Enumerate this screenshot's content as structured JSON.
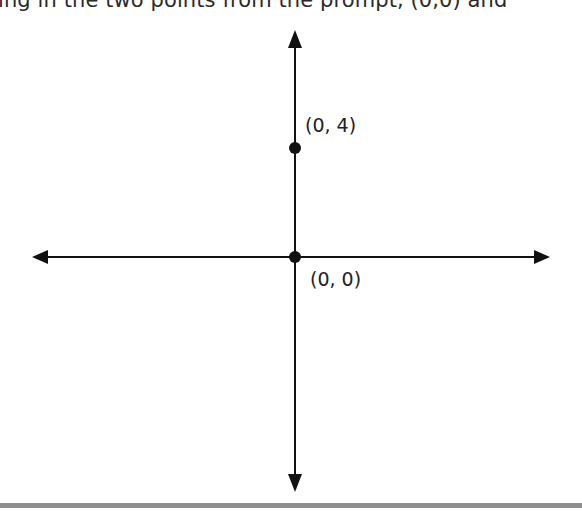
{
  "header": {
    "partial_text": "ing in the two points from the prompt, (0,0) and"
  },
  "diagram": {
    "type": "coordinate-plane",
    "axes": {
      "horizontal": {
        "y": 257,
        "x_start": 32,
        "x_end": 550,
        "arrows": "both"
      },
      "vertical": {
        "x": 295,
        "y_start": 30,
        "y_end": 492,
        "arrows": "both"
      },
      "color": "#111111"
    },
    "points": [
      {
        "label": "(0, 4)",
        "x": 0,
        "y": 4,
        "px": 295,
        "py": 148
      },
      {
        "label": "(0, 0)",
        "x": 0,
        "y": 0,
        "px": 295,
        "py": 257
      }
    ]
  },
  "footer": {
    "rule_color": "#8f8f8f"
  }
}
